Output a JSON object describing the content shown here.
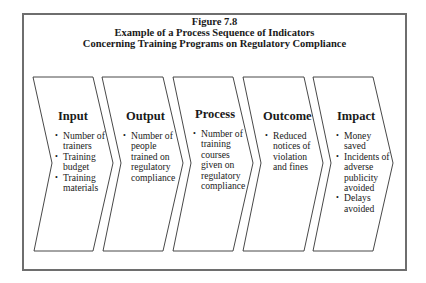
{
  "figure": {
    "title_lines": [
      "Figure 7.8",
      "Example of a Process Sequence of Indicators",
      "Concerning Training Programs on Regulatory Compliance"
    ]
  },
  "stages": [
    {
      "heading": "Input",
      "bullets": [
        "Number of\ntrainers",
        "Training\nbudget",
        "Training\nmaterials"
      ]
    },
    {
      "heading": "Output",
      "bullets": [
        "Number of\npeople\ntrained on\nregulatory\ncompliance"
      ]
    },
    {
      "heading": "Process",
      "bullets": [
        "Number of\ntraining\ncourses\ngiven on\nregulatory\ncompliance"
      ]
    },
    {
      "heading": "Outcome",
      "bullets": [
        "Reduced\nnotices of\nviolation\nand fines"
      ]
    },
    {
      "heading": "Impact",
      "bullets": [
        "Money\nsaved",
        "Incidents of\nadverse\npublicity\navoided",
        "Delays\navoided"
      ]
    }
  ],
  "colors": {
    "frame_border": "#6e6e6e",
    "chevron_stroke": "#333333",
    "text": "#1a1a1a",
    "background": "#ffffff"
  }
}
